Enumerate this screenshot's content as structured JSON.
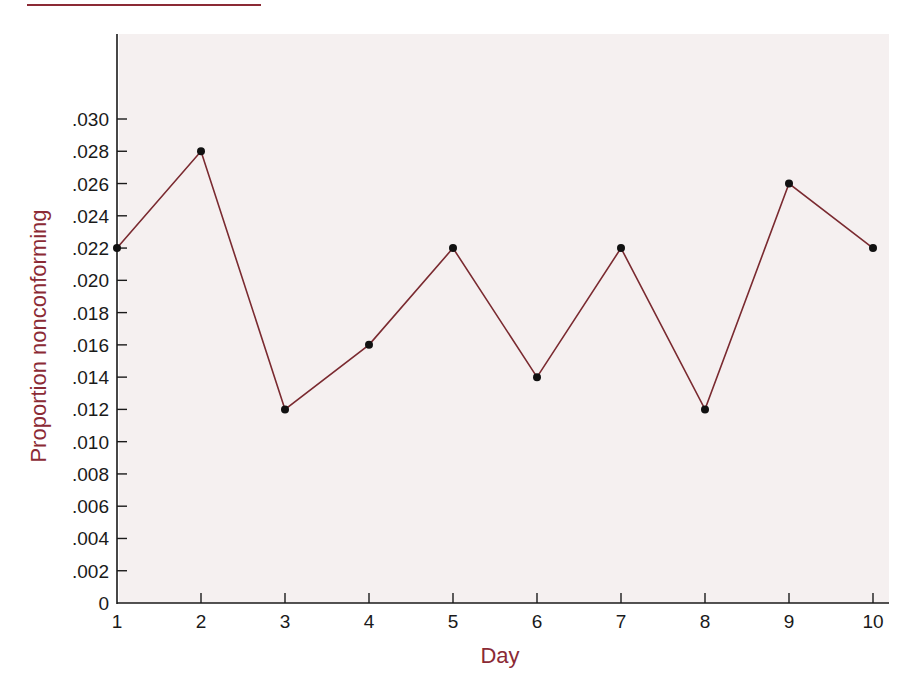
{
  "chart_data": {
    "type": "line",
    "title": "",
    "xlabel": "Day",
    "ylabel": "Proportion nonconforming",
    "x": [
      1,
      2,
      3,
      4,
      5,
      6,
      7,
      8,
      9,
      10
    ],
    "x_tick_labels": [
      "1",
      "2",
      "3",
      "4",
      "5",
      "6",
      "7",
      "8",
      "9",
      "10"
    ],
    "series": [
      {
        "name": "Proportion nonconforming",
        "values": [
          0.022,
          0.028,
          0.012,
          0.016,
          0.022,
          0.014,
          0.022,
          0.012,
          0.026,
          0.022
        ]
      }
    ],
    "y_ticks": [
      0,
      0.002,
      0.004,
      0.006,
      0.008,
      0.01,
      0.012,
      0.014,
      0.016,
      0.018,
      0.02,
      0.022,
      0.024,
      0.026,
      0.028,
      0.03
    ],
    "y_tick_labels": [
      "0",
      ".002",
      ".004",
      ".006",
      ".008",
      ".010",
      ".012",
      ".014",
      ".016",
      ".018",
      ".020",
      ".022",
      ".024",
      ".026",
      ".028",
      ".030"
    ],
    "xlim": [
      1,
      10
    ],
    "ylim": [
      0,
      0.03
    ],
    "grid": false,
    "legend": "none",
    "colors": {
      "line": "#7a2a30",
      "marker": "#111111",
      "axis_title": "#8b2a35",
      "plot_background": "#f5f0f0",
      "axis": "#1a1a1a"
    }
  }
}
